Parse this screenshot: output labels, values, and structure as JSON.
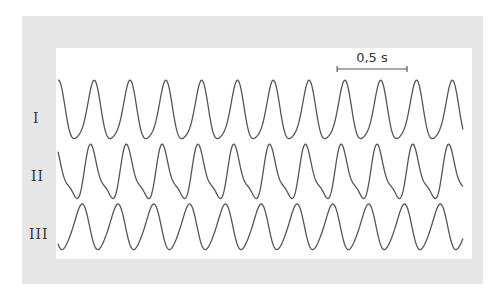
{
  "chart_data": {
    "type": "line",
    "title": "",
    "xlabel": "",
    "ylabel": "",
    "scale_bar": {
      "label": "0,5 s",
      "duration_s": 0.5
    },
    "duration_s": 2.9,
    "frequency_hz": 3.9,
    "grid": false,
    "legend": "none",
    "series": [
      {
        "name": "I",
        "label": "I",
        "harmonic_amp": 0.18,
        "harmonic_phase": 1.2,
        "phase": 0.0
      },
      {
        "name": "II",
        "label": "II",
        "harmonic_amp": 0.3,
        "harmonic_phase": 2.4,
        "phase": 0.35
      },
      {
        "name": "III",
        "label": "III",
        "harmonic_amp": 0.12,
        "harmonic_phase": 0.5,
        "phase": 2.2
      }
    ]
  },
  "colors": {
    "trace": "#555555",
    "frame": "#e6e6e6"
  }
}
